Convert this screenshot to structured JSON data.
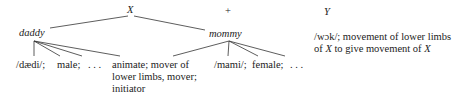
{
  "diagram": {
    "top": {
      "x_label": "X",
      "plus_label": "+",
      "y_label": "Y"
    },
    "nodes": {
      "daddy": "daddy",
      "mommy": "mommy"
    },
    "daddy_features": {
      "phon": "/dædi/;",
      "male": "male;",
      "ellipsis": ". . .",
      "animate_line1": "animate; mover of",
      "animate_line2": "lower limbs, mover;",
      "animate_line3": "initiator"
    },
    "mommy_features": {
      "phon": "/mami/;",
      "female": "female;",
      "ellipsis": ". . ."
    },
    "y_definition": {
      "line1": "/wɔk/; movement of lower limbs",
      "line2_prefix": "of ",
      "line2_x": "X",
      "line2_mid": " to give movement of ",
      "line2_x2": "X"
    }
  }
}
